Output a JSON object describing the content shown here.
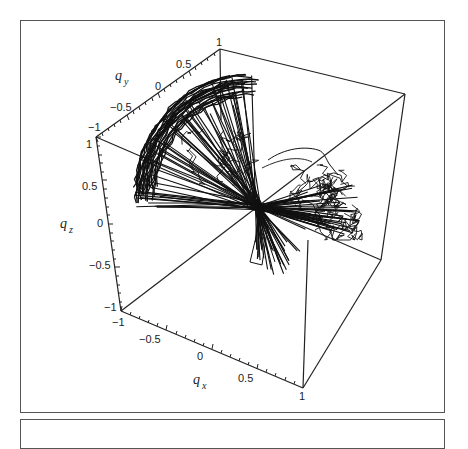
{
  "chart_data": {
    "type": "line3d",
    "title": "",
    "axes": {
      "x": {
        "label": "q",
        "subscript": "x",
        "range": [
          -1,
          1
        ],
        "ticks": [
          "-1",
          "-0.5",
          "0",
          "0.5",
          "1"
        ]
      },
      "y": {
        "label": "q",
        "subscript": "y",
        "range": [
          -1,
          1
        ],
        "ticks": [
          "-1",
          "-0.5",
          "0",
          "0.5",
          "1"
        ]
      },
      "z": {
        "label": "q",
        "subscript": "z",
        "range": [
          -1,
          1
        ],
        "ticks": [
          "-1",
          "-0.5",
          "0",
          "0.5",
          "1"
        ]
      }
    },
    "series_summary": "Dense black trajectories forming a hemispherical fan converging at origin; tangled cluster on +x side",
    "line_color": "#111111",
    "box": true,
    "grid": false,
    "legend": null
  },
  "labels": {
    "qy_title": "q",
    "qy_sub": "y",
    "qz_title": "q",
    "qz_sub": "z",
    "qx_title": "q",
    "qx_sub": "x",
    "y_ticks": [
      "−1",
      "−0.5",
      "0",
      "0.5",
      "1"
    ],
    "z_ticks": [
      "1",
      "0.5",
      "0",
      "−0.5",
      "−1"
    ],
    "x_ticks": [
      "−1",
      "−0.5",
      "0",
      "0.5",
      "1"
    ]
  }
}
